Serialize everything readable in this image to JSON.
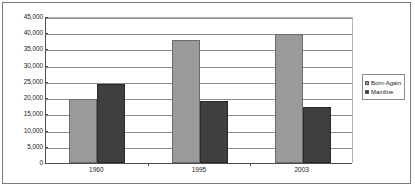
{
  "chart_data": {
    "type": "bar",
    "title": "",
    "subtitle": "",
    "xlabel": "",
    "ylabel": "",
    "categories": [
      "1960",
      "1995",
      "2003"
    ],
    "series": [
      {
        "name": "Born-Again",
        "color": "#9a9a9a",
        "values": [
          19800,
          38000,
          39700
        ]
      },
      {
        "name": "Mainline",
        "color": "#3f3f3f",
        "values": [
          24500,
          19000,
          17400
        ]
      }
    ],
    "ylim": [
      0,
      45000
    ],
    "ytick_step": 5000,
    "ytick_labels": [
      "45,000",
      "40,000",
      "35,000",
      "30,000",
      "25,000",
      "20,000",
      "15,000",
      "10,000",
      "5,000",
      "0"
    ],
    "ytick_values": [
      45000,
      40000,
      35000,
      30000,
      25000,
      20000,
      15000,
      10000,
      5000,
      0
    ],
    "grid": true,
    "legend_position": "right",
    "legend_entries": [
      "Born-Again",
      "Mainline"
    ]
  }
}
